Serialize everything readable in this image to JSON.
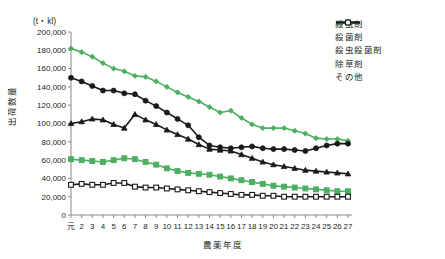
{
  "chart_data": {
    "type": "line",
    "title": "",
    "unit_label": "(t・kl)",
    "xlabel": "農薬年度",
    "ylabel": "出荷数量",
    "ylim": [
      0,
      200000
    ],
    "ytick_values": [
      0,
      20000,
      40000,
      60000,
      80000,
      100000,
      120000,
      140000,
      160000,
      180000,
      200000
    ],
    "ytick_labels": [
      "0",
      "20,000",
      "40,000",
      "60,000",
      "80,000",
      "100,000",
      "120,000",
      "140,000",
      "160,000",
      "180,000",
      "200,000"
    ],
    "grid": false,
    "legend_position": "top-right",
    "categories": [
      "元",
      "2",
      "3",
      "4",
      "5",
      "6",
      "7",
      "8",
      "9",
      "10",
      "11",
      "12",
      "13",
      "14",
      "15",
      "16",
      "17",
      "18",
      "19",
      "20",
      "21",
      "22",
      "23",
      "24",
      "25",
      "26",
      "27"
    ],
    "series": [
      {
        "name": "殺虫剤",
        "color": "#4CAF62",
        "marker": "diamond",
        "marker_fill": "#4CAF62",
        "values": [
          182000,
          178000,
          173000,
          166000,
          160000,
          157000,
          152000,
          151000,
          146000,
          140000,
          134000,
          129000,
          124000,
          118000,
          112000,
          114000,
          106000,
          99000,
          95000,
          95000,
          95000,
          92000,
          89000,
          84000,
          83000,
          83000,
          81000
        ]
      },
      {
        "name": "殺菌剤",
        "color": "#1a1a1a",
        "marker": "triangle",
        "marker_fill": "#1a1a1a",
        "values": [
          100000,
          102000,
          105000,
          104000,
          99000,
          95000,
          110000,
          104000,
          99000,
          93000,
          88000,
          83000,
          77000,
          72000,
          71000,
          70000,
          66000,
          62000,
          58000,
          55000,
          53000,
          51000,
          49000,
          48000,
          47000,
          46000,
          45000
        ]
      },
      {
        "name": "殺虫殺菌剤",
        "color": "#4CAF62",
        "marker": "square",
        "marker_fill": "#4CAF62",
        "values": [
          61000,
          60000,
          59000,
          58000,
          60000,
          62000,
          61000,
          58000,
          55000,
          51000,
          48000,
          46000,
          45000,
          44000,
          42000,
          40000,
          38000,
          36000,
          34000,
          32000,
          31000,
          30000,
          29000,
          28000,
          27000,
          26000,
          26000
        ]
      },
      {
        "name": "除草剤",
        "color": "#1a1a1a",
        "marker": "circle",
        "marker_fill": "#1a1a1a",
        "values": [
          150000,
          146000,
          141000,
          136000,
          136000,
          133000,
          132000,
          125000,
          119000,
          112000,
          105000,
          98000,
          85000,
          76000,
          74000,
          73000,
          74000,
          75000,
          73000,
          72000,
          72000,
          71000,
          70000,
          73000,
          76000,
          78000,
          78000
        ]
      },
      {
        "name": "その他",
        "color": "#1a1a1a",
        "marker": "square-open",
        "marker_fill": "#ffffff",
        "values": [
          33000,
          34000,
          33000,
          33000,
          35000,
          35000,
          31000,
          30000,
          30000,
          29000,
          28000,
          27000,
          26000,
          25000,
          24000,
          23000,
          22000,
          22000,
          21000,
          21000,
          20000,
          20000,
          20000,
          20000,
          20000,
          20000,
          20000
        ]
      }
    ]
  }
}
